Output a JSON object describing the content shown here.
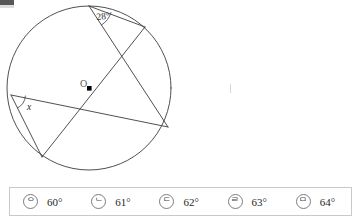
{
  "figure": {
    "center_label": "O",
    "angle_label": "28°",
    "unknown_label": "x",
    "stroke_color": "#3c3c3c",
    "center_dot_color": "#000000"
  },
  "choices": {
    "items": [
      {
        "marker": "ᄋ",
        "label": "60°"
      },
      {
        "marker": "ᄂ",
        "label": "61°"
      },
      {
        "marker": "ᄃ",
        "label": "62°"
      },
      {
        "marker": "ᄅ",
        "label": "63°"
      },
      {
        "marker": "ᄆ",
        "label": "64°"
      }
    ]
  }
}
